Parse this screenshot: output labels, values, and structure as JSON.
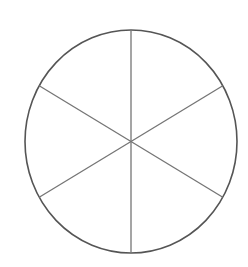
{
  "figure": {
    "type": "fraction-circle",
    "title": "Circle divided into six equal sectors",
    "background_color": "#ffffff",
    "canvas": {
      "width": 248,
      "height": 267
    },
    "circle": {
      "center_x": 131,
      "center_y": 141.5,
      "radius_x": 106,
      "radius_y": 111.5,
      "outline_color": "#555555",
      "outline_width": 1.6,
      "fill_color": "none"
    },
    "dividers": {
      "count": 3,
      "color": "#757575",
      "width": 1.3,
      "angles_deg": [
        90,
        30,
        150
      ],
      "lines": [
        {
          "name": "vertical-diameter",
          "x1": 131,
          "y1": 30,
          "x2": 131,
          "y2": 253
        },
        {
          "name": "diagonal-diameter-up-right",
          "x1": 39.2,
          "y1": 85.8,
          "x2": 222.8,
          "y2": 197.2
        },
        {
          "name": "diagonal-diameter-down-right",
          "x1": 39.2,
          "y1": 197.2,
          "x2": 222.8,
          "y2": 85.8
        }
      ]
    },
    "sectors": {
      "total": 6,
      "shaded": 0,
      "sector_angle_deg": 60,
      "fraction_each": "1/6"
    },
    "labels": []
  }
}
